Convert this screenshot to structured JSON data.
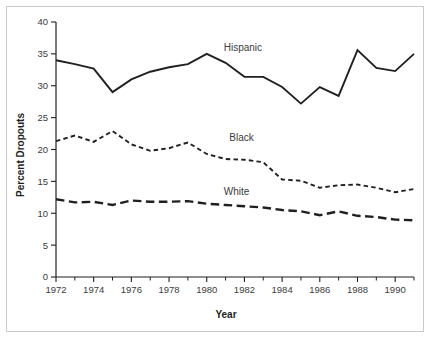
{
  "figure": {
    "border_color": "#c9c9c9",
    "background": "#ffffff",
    "ink_color": "#231f20"
  },
  "axes": {
    "x_title": "Year",
    "y_title": "Percent Dropouts",
    "x_tick_labels": [
      "1972",
      "1974",
      "1976",
      "1978",
      "1980",
      "1982",
      "1984",
      "1986",
      "1988",
      "1990"
    ],
    "y_tick_labels": [
      "0",
      "5",
      "10",
      "15",
      "20",
      "25",
      "30",
      "35",
      "40"
    ]
  },
  "series_labels": {
    "hispanic": "Hispanic",
    "black": "Black",
    "white": "White"
  },
  "chart_data": {
    "type": "line",
    "title": "",
    "subtitle": "",
    "xlabel": "Year",
    "ylabel": "Percent Dropouts",
    "xlim": [
      1972,
      1991
    ],
    "ylim": [
      0,
      40
    ],
    "yticks": [
      0,
      5,
      10,
      15,
      20,
      25,
      30,
      35,
      40
    ],
    "xticks": [
      1972,
      1974,
      1976,
      1978,
      1980,
      1982,
      1984,
      1986,
      1988,
      1990
    ],
    "x_minor_ticks": [
      1973,
      1975,
      1977,
      1979,
      1981,
      1983,
      1985,
      1987,
      1989,
      1991
    ],
    "grid": false,
    "legend": "inline-annotations",
    "x": [
      1972,
      1973,
      1974,
      1975,
      1976,
      1977,
      1978,
      1979,
      1980,
      1981,
      1982,
      1983,
      1984,
      1985,
      1986,
      1987,
      1988,
      1989,
      1990,
      1991
    ],
    "series": [
      {
        "name": "Hispanic",
        "style": "solid",
        "values": [
          34.0,
          33.4,
          32.7,
          29.0,
          31.0,
          32.2,
          32.9,
          33.4,
          35.0,
          33.6,
          31.4,
          31.4,
          29.8,
          27.2,
          29.8,
          28.4,
          35.6,
          32.8,
          32.3,
          35.0
        ],
        "label_position": {
          "x": 1980.9,
          "y": 35.4
        }
      },
      {
        "name": "Black",
        "style": "short-dash",
        "values": [
          21.3,
          22.2,
          21.2,
          22.9,
          20.8,
          19.8,
          20.2,
          21.1,
          19.3,
          18.5,
          18.4,
          18.0,
          15.3,
          15.1,
          14.0,
          14.4,
          14.5,
          14.0,
          13.3,
          13.8
        ],
        "label_position": {
          "x": 1981.2,
          "y": 21.3
        }
      },
      {
        "name": "White",
        "style": "long-dash",
        "values": [
          12.2,
          11.7,
          11.8,
          11.3,
          12.0,
          11.8,
          11.8,
          11.9,
          11.5,
          11.3,
          11.1,
          10.9,
          10.5,
          10.3,
          9.7,
          10.3,
          9.6,
          9.4,
          9.0,
          8.9
        ],
        "label_position": {
          "x": 1980.9,
          "y": 12.9
        }
      }
    ]
  }
}
